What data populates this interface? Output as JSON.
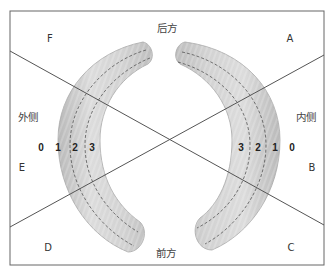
{
  "diagram": {
    "frame": {
      "left": 10,
      "top": 11,
      "right": 324,
      "bottom": 265,
      "stroke": "#666666"
    },
    "lines": [
      {
        "name": "diagonal-line-F-to-B",
        "x1": 10,
        "y1": 51,
        "x2": 324,
        "y2": 225
      },
      {
        "name": "diagonal-line-E-to-A",
        "x1": 10,
        "y1": 227,
        "x2": 324,
        "y2": 55
      }
    ],
    "menisci": {
      "fill": "#cfcfcf",
      "edge": "#a8a8a8",
      "dash_color": "#444444"
    },
    "labels": {
      "posterior": "后方",
      "anterior": "前方",
      "lateral": "外侧",
      "medial": "内侧",
      "zone_A": "A",
      "zone_B": "B",
      "zone_C": "C",
      "zone_D": "D",
      "zone_E": "E",
      "zone_F": "F"
    },
    "left_zone_numbers": [
      "0",
      "1",
      "2",
      "3"
    ],
    "right_zone_numbers": [
      "3",
      "2",
      "1",
      "0"
    ]
  }
}
